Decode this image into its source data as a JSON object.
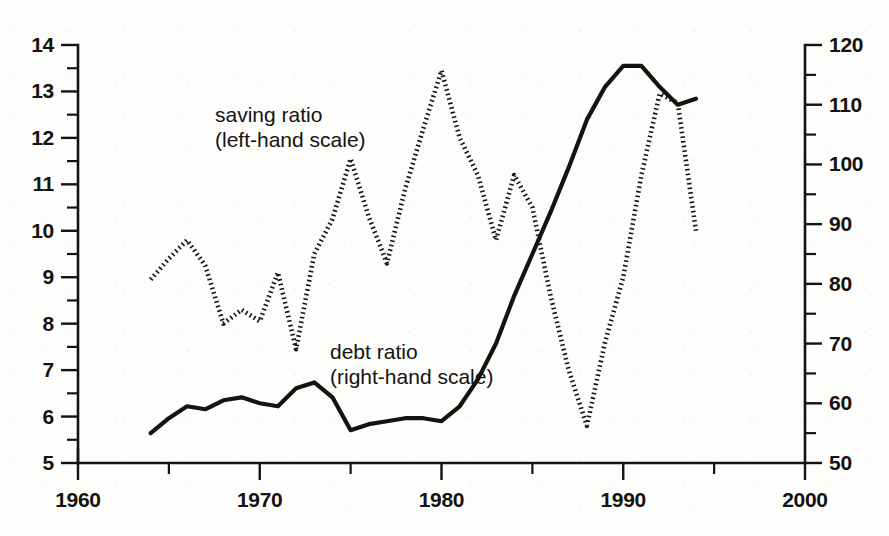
{
  "figure": {
    "background_color": "#fdfdfc",
    "ink_color": "#15120f"
  },
  "annotations": {
    "saving": {
      "line1": "saving ratio",
      "line2": "(left-hand scale)",
      "x": 215,
      "y": 122
    },
    "debt": {
      "line1": "debt ratio",
      "line2": "(right-hand scale)",
      "x": 330,
      "y": 359
    }
  },
  "chart_data": {
    "type": "line",
    "title": "",
    "xlabel": "",
    "ylabel": "",
    "grid": false,
    "legend": "inline-annotations",
    "xlim": [
      1960,
      2000
    ],
    "xticks": [
      1960,
      1970,
      1980,
      1990,
      2000
    ],
    "xticks_minor": [
      1965,
      1975,
      1985,
      1995
    ],
    "left_axis": {
      "label": "saving ratio",
      "ylim": [
        5,
        14
      ],
      "yticks": [
        5,
        6,
        7,
        8,
        9,
        10,
        11,
        12,
        13,
        14
      ],
      "yticks_minor": [
        5.5,
        6.5,
        7.5,
        8.5,
        9.5,
        10.5,
        11.5,
        12.5,
        13.5
      ],
      "ticklabels": [
        "5",
        "6",
        "7",
        "8",
        "9",
        "10",
        "11",
        "12",
        "13",
        "14"
      ]
    },
    "right_axis": {
      "label": "debt ratio",
      "ylim": [
        50,
        120
      ],
      "yticks": [
        50,
        60,
        70,
        80,
        90,
        100,
        110,
        120
      ],
      "yticks_minor": [
        55,
        65,
        75,
        85,
        95,
        105,
        115
      ],
      "ticklabels": [
        "50",
        "60",
        "70",
        "80",
        "90",
        "100",
        "110",
        "120"
      ]
    },
    "series": [
      {
        "name": "saving ratio (left-hand scale)",
        "axis": "left",
        "style": "dotted",
        "x": [
          1964,
          1965,
          1966,
          1967,
          1968,
          1969,
          1970,
          1971,
          1972,
          1973,
          1974,
          1975,
          1976,
          1977,
          1978,
          1979,
          1980,
          1981,
          1982,
          1983,
          1984,
          1985,
          1986,
          1987,
          1988,
          1989,
          1990,
          1991,
          1992,
          1993,
          1994
        ],
        "values": [
          8.95,
          9.4,
          9.8,
          9.25,
          8.0,
          8.3,
          8.05,
          9.1,
          7.45,
          9.5,
          10.25,
          11.55,
          10.3,
          9.3,
          10.9,
          12.2,
          13.45,
          12.0,
          11.2,
          9.8,
          11.2,
          10.5,
          8.6,
          7.0,
          5.8,
          7.6,
          9.0,
          11.2,
          12.95,
          12.75,
          10.0
        ]
      },
      {
        "name": "debt ratio (right-hand scale)",
        "axis": "right",
        "style": "solid",
        "x": [
          1964,
          1965,
          1966,
          1967,
          1968,
          1969,
          1970,
          1971,
          1972,
          1973,
          1974,
          1975,
          1976,
          1977,
          1978,
          1979,
          1980,
          1981,
          1982,
          1983,
          1984,
          1985,
          1986,
          1987,
          1988,
          1989,
          1990,
          1991,
          1992,
          1993,
          1994
        ],
        "values": [
          55.0,
          57.5,
          59.5,
          59.0,
          60.5,
          61.0,
          60.0,
          59.5,
          62.5,
          63.5,
          61.0,
          55.5,
          56.5,
          57.0,
          57.5,
          57.5,
          57.0,
          59.5,
          64.0,
          70.0,
          78.0,
          85.0,
          92.0,
          99.5,
          107.5,
          113.0,
          116.5,
          116.5,
          113.0,
          110.0,
          111.0
        ]
      }
    ]
  }
}
